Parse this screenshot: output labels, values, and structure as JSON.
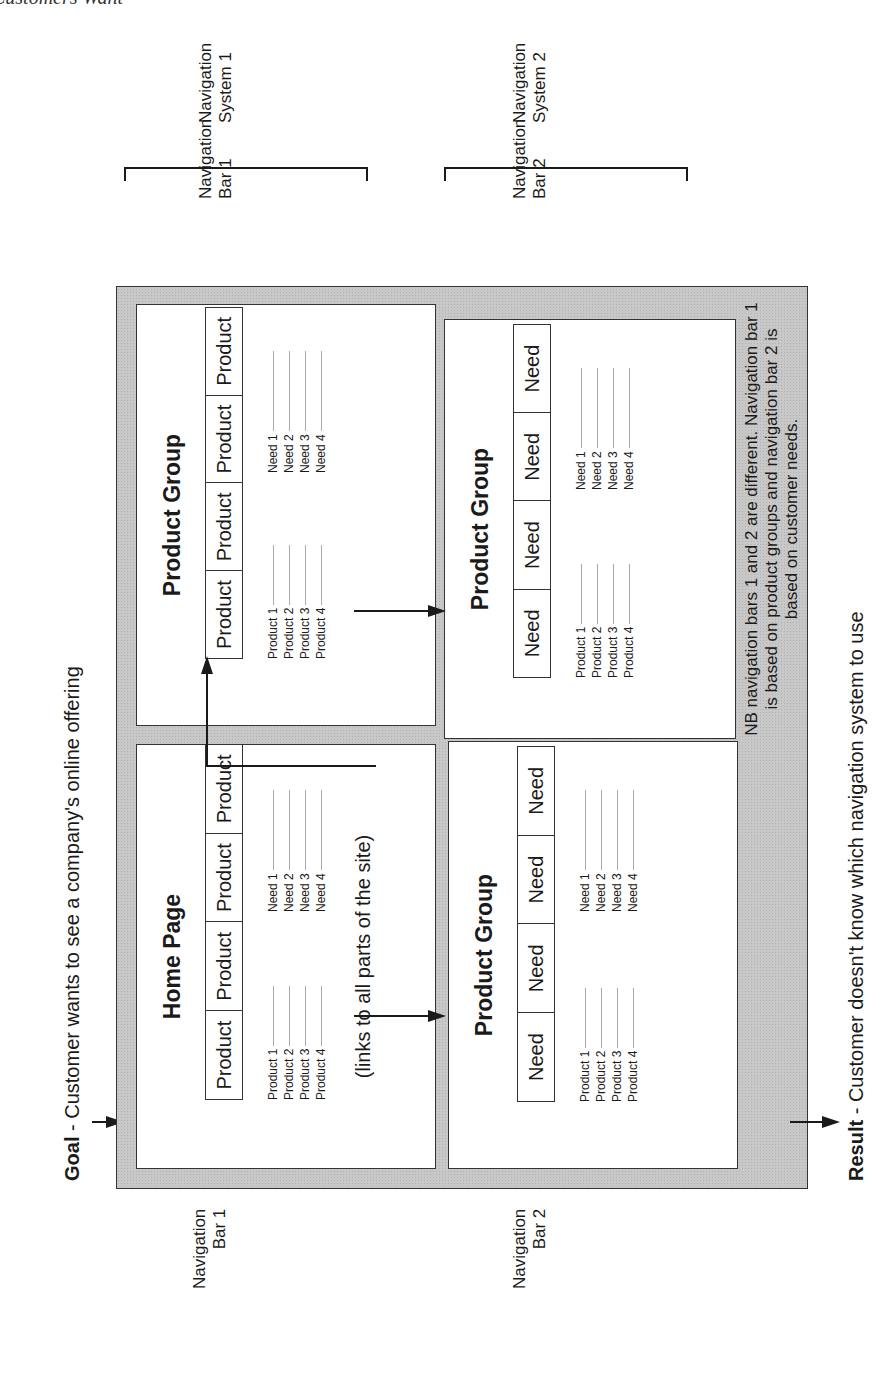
{
  "page": {
    "running_header": "Customers Want"
  },
  "goal": {
    "label": "Goal",
    "text": " - Customer wants to see a company's online offering"
  },
  "result": {
    "label": "Result",
    "text": " - Customer doesn't know which navigation system to use"
  },
  "navigation_systems": [
    {
      "line1": "Navigation",
      "line2": "System 1"
    },
    {
      "line1": "Navigation",
      "line2": "System 2"
    }
  ],
  "navigation_bars_top": [
    {
      "line1": "Navigation",
      "line2": "Bar 1"
    },
    {
      "line1": "Navigation",
      "line2": "Bar 2"
    }
  ],
  "navigation_bars_left": [
    {
      "line1": "Navigation",
      "line2": "Bar 1"
    },
    {
      "line1": "Navigation",
      "line2": "Bar 2"
    }
  ],
  "panels": {
    "home": {
      "title": "Home Page",
      "nav": [
        "Product",
        "Product",
        "Product",
        "Product"
      ],
      "left_list": [
        "Product 1",
        "Product 2",
        "Product 3",
        "Product 4"
      ],
      "right_list": [
        "Need 1",
        "Need 2",
        "Need 3",
        "Need 4"
      ],
      "caption": "(links to all parts of the site)"
    },
    "group1": {
      "title": "Product Group",
      "nav": [
        "Product",
        "Product",
        "Product",
        "Product"
      ],
      "left_list": [
        "Product 1",
        "Product 2",
        "Product 3",
        "Product 4"
      ],
      "right_list": [
        "Need 1",
        "Need 2",
        "Need 3",
        "Need 4"
      ]
    },
    "group2": {
      "title": "Product Group",
      "nav": [
        "Need",
        "Need",
        "Need",
        "Need"
      ],
      "left_list": [
        "Product 1",
        "Product 2",
        "Product 3",
        "Product 4"
      ],
      "right_list": [
        "Need 1",
        "Need 2",
        "Need 3",
        "Need 4"
      ]
    },
    "group3": {
      "title": "Product Group",
      "nav": [
        "Need",
        "Need",
        "Need",
        "Need"
      ],
      "left_list": [
        "Product 1",
        "Product 2",
        "Product 3",
        "Product 4"
      ],
      "right_list": [
        "Need 1",
        "Need 2",
        "Need 3",
        "Need 4"
      ]
    }
  },
  "note": {
    "line1": "NB navigation bars 1 and 2 are different. Navigation bar 1",
    "line2": "is based on product groups and navigation bar 2 is",
    "line3": "based on customer needs."
  },
  "colors": {
    "shade": "#c8c8c8",
    "ink": "#1a1a1a",
    "panel": "#ffffff"
  }
}
